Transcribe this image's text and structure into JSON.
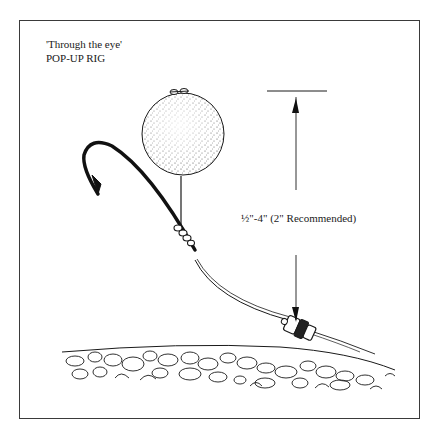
{
  "diagram": {
    "title_line1": "'Through the eye'",
    "title_line2": "POP-UP RIG",
    "measurement_label": "½\"-4\" (2\" Recommended)",
    "components": [
      "hook",
      "pop-up bait",
      "hair",
      "knot",
      "hooklink",
      "swivel",
      "lake bed"
    ],
    "colors": {
      "ink": "#1a1a1a",
      "background": "#ffffff",
      "frame": "#3a3a3a"
    }
  }
}
